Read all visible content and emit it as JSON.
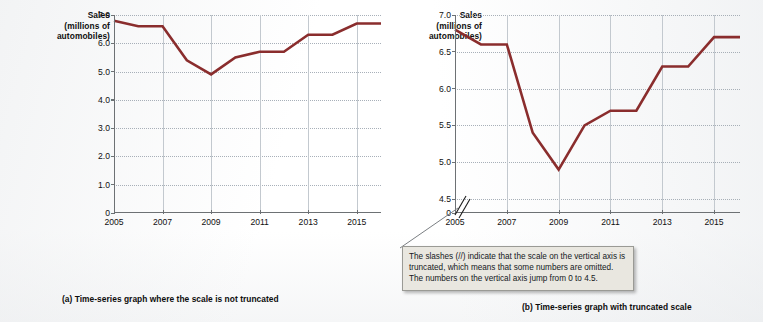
{
  "figure": {
    "background_color": "#ffffff",
    "line_color": "#8a2d2d",
    "grid_color": "#9aa3ad",
    "axis_color": "#6d7174"
  },
  "panel_a": {
    "caption": "(a) Time-series graph where the scale is not truncated",
    "axis_title_lines": [
      "Sales",
      "(millions of",
      "automobiles)"
    ],
    "chart_data": {
      "type": "line",
      "title": "",
      "subtitle": "",
      "xlabel": "",
      "ylabel": "Sales (millions of automobiles)",
      "x": [
        2005,
        2006,
        2007,
        2008,
        2009,
        2010,
        2011,
        2012,
        2013,
        2014,
        2015,
        2016
      ],
      "values": [
        6.8,
        6.6,
        6.6,
        5.4,
        4.9,
        5.5,
        5.7,
        5.7,
        6.3,
        6.3,
        6.7,
        6.7
      ],
      "series": [
        {
          "name": "Sales",
          "values": [
            6.8,
            6.6,
            6.6,
            5.4,
            4.9,
            5.5,
            5.7,
            5.7,
            6.3,
            6.3,
            6.7,
            6.7
          ]
        }
      ],
      "ylim": [
        0,
        7.0
      ],
      "xlim": [
        2005,
        2016
      ],
      "ytick_labels": [
        "7.0",
        "6.0",
        "5.0",
        "4.0",
        "3.0",
        "2.0",
        "1.0",
        "0"
      ],
      "ytick_values": [
        7.0,
        6.0,
        5.0,
        4.0,
        3.0,
        2.0,
        1.0,
        0
      ],
      "xtick_labels": [
        "2005",
        "2007",
        "2009",
        "2011",
        "2013",
        "2015"
      ],
      "xtick_values": [
        2005,
        2007,
        2009,
        2011,
        2013,
        2015
      ],
      "grid": "both",
      "legend": "none",
      "truncated_axis": false
    }
  },
  "panel_b": {
    "caption": "(b) Time-series graph with truncated scale",
    "axis_title_lines": [
      "Sales",
      "(millions of",
      "automobiles)"
    ],
    "callout_text": "The slashes (//) indicate that the scale on the vertical axis is truncated, which means that some numbers are omitted.  The numbers on the vertical axis jump from 0 to 4.5.",
    "chart_data": {
      "type": "line",
      "title": "",
      "subtitle": "",
      "xlabel": "",
      "ylabel": "Sales (millions of automobiles)",
      "x": [
        2005,
        2006,
        2007,
        2008,
        2009,
        2010,
        2011,
        2012,
        2013,
        2014,
        2015,
        2016
      ],
      "values": [
        6.8,
        6.6,
        6.6,
        5.4,
        4.9,
        5.5,
        5.7,
        5.7,
        6.3,
        6.3,
        6.7,
        6.7
      ],
      "series": [
        {
          "name": "Sales",
          "values": [
            6.8,
            6.6,
            6.6,
            5.4,
            4.9,
            5.5,
            5.7,
            5.7,
            6.3,
            6.3,
            6.7,
            6.7
          ]
        }
      ],
      "ylim": [
        4.5,
        7.0
      ],
      "xlim": [
        2005,
        2016
      ],
      "ytick_labels": [
        "7.0",
        "6.5",
        "6.0",
        "5.5",
        "5.0",
        "4.5",
        "0"
      ],
      "ytick_values": [
        7.0,
        6.5,
        6.0,
        5.5,
        5.0,
        4.5,
        0
      ],
      "xtick_labels": [
        "2005",
        "2007",
        "2009",
        "2011",
        "2013",
        "2015"
      ],
      "xtick_values": [
        2005,
        2007,
        2009,
        2011,
        2013,
        2015
      ],
      "grid": "both",
      "legend": "none",
      "truncated_axis": true,
      "axis_break_note": "slashes between 0 and 4.5"
    }
  }
}
